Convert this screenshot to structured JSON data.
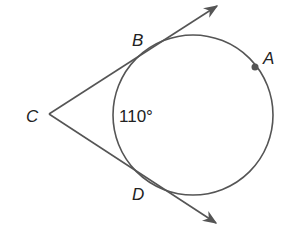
{
  "diagram": {
    "type": "geometry",
    "points": {
      "A": {
        "label": "A"
      },
      "B": {
        "label": "B"
      },
      "C": {
        "label": "C"
      },
      "D": {
        "label": "D"
      }
    },
    "angle_label": "110°",
    "colors": {
      "stroke": "#555555",
      "text": "#222222",
      "point": "#555555"
    }
  }
}
